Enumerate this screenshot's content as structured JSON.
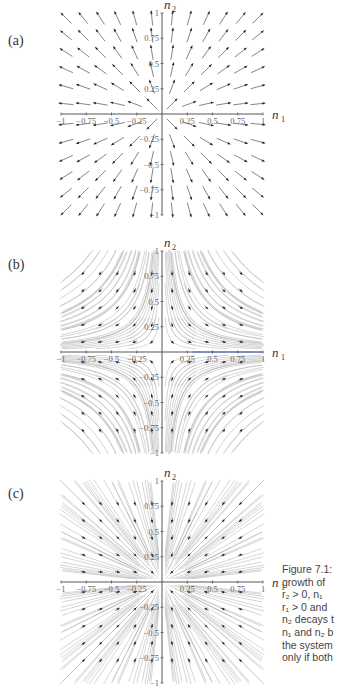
{
  "figure": {
    "panels": [
      {
        "id": "a",
        "label": "(a)",
        "label_top": 40,
        "origin_y": 114,
        "field": "unstable_node",
        "streamlines": false
      },
      {
        "id": "b",
        "label": "(b)",
        "label_top": 264,
        "origin_y": 352,
        "field": "saddle",
        "streamlines": true
      },
      {
        "id": "c",
        "label": "(c)",
        "label_top": 493,
        "origin_y": 582,
        "field": "stable_node",
        "streamlines": true
      }
    ],
    "axes": {
      "x_label": "n",
      "x_sub": "1",
      "y_label": "n",
      "y_sub": "2",
      "x_ticks": [
        "-1",
        "-0.75",
        "-0.5",
        "-0.25",
        "0.25",
        "0.5",
        "0.75",
        "1"
      ],
      "y_ticks": [
        "1",
        "0.75",
        "0.5",
        "0.25",
        "-0.25",
        "-0.5",
        "-0.75",
        "-1"
      ],
      "range": [
        -1,
        1
      ]
    },
    "caption_lines": [
      "Figure 7.1:",
      "growth of",
      "r₂ > 0, n₁ ",
      "r₁ > 0 and",
      "n₂ decays t",
      "n₁ and n₂ b",
      "the system",
      "only if both"
    ]
  },
  "chart_data": [
    {
      "type": "vector_field",
      "panel": "(a)",
      "title": "",
      "xlabel": "n1",
      "ylabel": "n2",
      "xlim": [
        -1,
        1
      ],
      "ylim": [
        -1,
        1
      ],
      "x_ticks": [
        -1,
        -0.75,
        -0.5,
        -0.25,
        0.25,
        0.5,
        0.75,
        1
      ],
      "y_ticks": [
        -1,
        -0.75,
        -0.5,
        -0.25,
        0.25,
        0.5,
        0.75,
        1
      ],
      "description": "Unstable node: dn1/dt = r1 n1, dn2/dt = r2 n2 with r1>0, r2>0; arrows point away from origin",
      "r1": 1,
      "r2": 1
    },
    {
      "type": "vector_field",
      "panel": "(b)",
      "title": "",
      "xlabel": "n1",
      "ylabel": "n2",
      "xlim": [
        -1,
        1
      ],
      "ylim": [
        -1,
        1
      ],
      "x_ticks": [
        -1,
        -0.75,
        -0.5,
        -0.25,
        0.25,
        0.5,
        0.75,
        1
      ],
      "y_ticks": [
        -1,
        -0.75,
        -0.5,
        -0.25,
        0.25,
        0.5,
        0.75,
        1
      ],
      "description": "Saddle: r1>0, r2<0; n1 grows, n2 decays; with streamlines",
      "r1": 1,
      "r2": -1
    },
    {
      "type": "vector_field",
      "panel": "(c)",
      "title": "",
      "xlabel": "n1",
      "ylabel": "n2",
      "xlim": [
        -1,
        1
      ],
      "ylim": [
        -1,
        1
      ],
      "x_ticks": [
        -1,
        -0.75,
        -0.5,
        -0.25,
        0.25,
        0.5,
        0.75,
        1
      ],
      "y_ticks": [
        -1,
        -0.75,
        -0.5,
        -0.25,
        0.25,
        0.5,
        0.75,
        1
      ],
      "description": "Stable node: r1<0, r2<0; arrows point toward origin; with streamlines",
      "r1": -1,
      "r2": -1
    }
  ]
}
